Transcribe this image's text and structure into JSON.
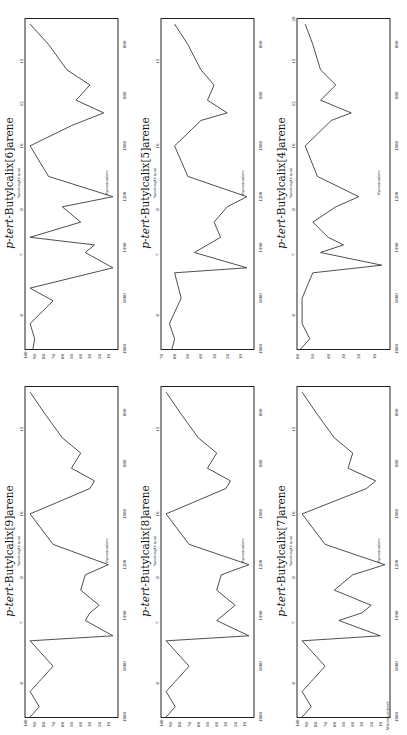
{
  "page": {
    "orientation": "rotated -90deg",
    "footer_text": "Wavenumbers"
  },
  "panels": [
    {
      "title_prefix": "p-tert-",
      "title_rest": "Butylcalix[6]arene",
      "wavelength_label": "Wavelength (um)",
      "wavenumber_label": "Wavenumbers",
      "y_ticks": [
        "100",
        "90",
        "80",
        "70",
        "60",
        "50",
        "40",
        "30",
        "20",
        "10"
      ],
      "x_ticks": [
        "1800",
        "1600",
        "1400",
        "1200",
        "1000",
        "800",
        "600"
      ],
      "w_ticks": [
        "6",
        "7",
        "8",
        "10",
        "12",
        "15"
      ]
    },
    {
      "title_prefix": "p-tert-",
      "title_rest": "Butylcalix[5]arene",
      "wavelength_label": "Wavelength (um)",
      "wavenumber_label": "Wavenumbers",
      "y_ticks": [
        "70",
        "60",
        "50",
        "40",
        "30",
        "20",
        "10"
      ],
      "x_ticks": [
        "1800",
        "1600",
        "1400",
        "1200",
        "1000",
        "800",
        "600"
      ],
      "w_ticks": [
        "6",
        "7",
        "8",
        "10",
        "15"
      ]
    },
    {
      "title_prefix": "p-tert-",
      "title_rest": "Butylcalix[4]arene",
      "wavelength_label": "Wavelength (um)",
      "wavenumber_label": "Wavenumbers",
      "y_ticks": [
        "60",
        "50",
        "40",
        "30",
        "20",
        "10"
      ],
      "x_ticks": [
        "1800",
        "1600",
        "1400",
        "1200",
        "1000",
        "800",
        "600"
      ],
      "w_ticks": [
        "6",
        "7",
        "8",
        "10",
        "12",
        "15",
        "20"
      ]
    },
    {
      "title_prefix": "p-tert-",
      "title_rest": "Butylcalix[9]arene",
      "wavelength_label": "Wavelength (um)",
      "wavenumber_label": "Wavenumbers",
      "y_ticks": [
        "100",
        "90",
        "80",
        "70",
        "60",
        "50",
        "40",
        "30",
        "20",
        "10"
      ],
      "x_ticks": [
        "1800",
        "1600",
        "1400",
        "1200",
        "1000",
        "800",
        "600"
      ],
      "w_ticks": [
        "6",
        "7",
        "8",
        "10",
        "15"
      ]
    },
    {
      "title_prefix": "p-tert-",
      "title_rest": "Butylcalix[8]arene",
      "wavelength_label": "Wavelength (um)",
      "wavenumber_label": "Wavenumbers",
      "y_ticks": [
        "100",
        "90",
        "80",
        "70",
        "60",
        "50",
        "40",
        "30",
        "20",
        "10"
      ],
      "x_ticks": [
        "1800",
        "1600",
        "1400",
        "1200",
        "1000",
        "800",
        "600"
      ],
      "w_ticks": [
        "6",
        "7",
        "8",
        "10",
        "15"
      ]
    },
    {
      "title_prefix": "p-tert-",
      "title_rest": "Butylcalix[7]arene",
      "wavelength_label": "Wavelength (um)",
      "wavenumber_label": "Wavenumbers",
      "y_ticks": [
        "100",
        "90",
        "80",
        "70",
        "60",
        "50",
        "40",
        "30",
        "20",
        "10"
      ],
      "x_ticks": [
        "1800",
        "1600",
        "1400",
        "1200",
        "1000",
        "800",
        "600"
      ],
      "w_ticks": [
        "6",
        "7",
        "8",
        "10",
        "15"
      ]
    }
  ],
  "chart_data": [
    {
      "type": "line",
      "title": "p-tert-Butylcalix[4]arene",
      "xlabel": "Wavenumbers",
      "ylabel": "%T",
      "xlim": [
        1800,
        500
      ],
      "ylim": [
        0,
        60
      ],
      "x": [
        1800,
        1760,
        1700,
        1600,
        1500,
        1470,
        1420,
        1390,
        1360,
        1300,
        1240,
        1200,
        1120,
        1000,
        900,
        870,
        820,
        760,
        700,
        600,
        520
      ],
      "y": [
        58,
        52,
        57,
        57,
        50,
        5,
        45,
        30,
        40,
        50,
        35,
        20,
        47,
        55,
        38,
        25,
        45,
        35,
        45,
        50,
        55
      ]
    },
    {
      "type": "line",
      "title": "p-tert-Butylcalix[5]arene",
      "xlabel": "Wavenumbers",
      "ylabel": "%T",
      "xlim": [
        1800,
        500
      ],
      "ylim": [
        0,
        70
      ],
      "x": [
        1800,
        1760,
        1700,
        1600,
        1500,
        1480,
        1420,
        1390,
        1360,
        1300,
        1240,
        1200,
        1120,
        1000,
        900,
        870,
        820,
        760,
        700,
        600,
        520
      ],
      "y": [
        62,
        60,
        64,
        55,
        60,
        5,
        45,
        35,
        25,
        30,
        20,
        5,
        50,
        60,
        40,
        20,
        35,
        30,
        40,
        50,
        60
      ]
    },
    {
      "type": "line",
      "title": "p-tert-Butylcalix[6]arene",
      "xlabel": "Wavenumbers",
      "ylabel": "%T",
      "xlim": [
        1800,
        500
      ],
      "ylim": [
        0,
        100
      ],
      "x": [
        1800,
        1760,
        1700,
        1610,
        1560,
        1480,
        1420,
        1390,
        1360,
        1300,
        1240,
        1200,
        1120,
        1000,
        920,
        870,
        820,
        760,
        700,
        600,
        520
      ],
      "y": [
        92,
        90,
        95,
        70,
        95,
        5,
        35,
        25,
        95,
        40,
        60,
        5,
        75,
        95,
        50,
        15,
        45,
        30,
        55,
        75,
        95
      ]
    },
    {
      "type": "line",
      "title": "p-tert-Butylcalix[7]arene",
      "xlabel": "Wavenumbers",
      "ylabel": "%T",
      "xlim": [
        1800,
        500
      ],
      "ylim": [
        0,
        100
      ],
      "x": [
        1800,
        1760,
        1700,
        1600,
        1500,
        1480,
        1420,
        1390,
        1360,
        1300,
        1240,
        1200,
        1120,
        1000,
        900,
        870,
        820,
        760,
        700,
        600,
        520
      ],
      "y": [
        95,
        85,
        95,
        70,
        95,
        10,
        55,
        30,
        20,
        60,
        40,
        5,
        70,
        95,
        25,
        15,
        45,
        40,
        60,
        80,
        95
      ]
    },
    {
      "type": "line",
      "title": "p-tert-Butylcalix[8]arene",
      "xlabel": "Wavenumbers",
      "ylabel": "%T",
      "xlim": [
        1800,
        500
      ],
      "ylim": [
        0,
        100
      ],
      "x": [
        1800,
        1760,
        1700,
        1600,
        1500,
        1480,
        1420,
        1390,
        1360,
        1300,
        1240,
        1200,
        1120,
        1000,
        900,
        870,
        820,
        760,
        700,
        600,
        520
      ],
      "y": [
        95,
        85,
        95,
        70,
        95,
        5,
        40,
        30,
        20,
        40,
        35,
        5,
        70,
        95,
        30,
        25,
        50,
        40,
        60,
        80,
        95
      ]
    },
    {
      "type": "line",
      "title": "p-tert-Butylcalix[9]arene",
      "xlabel": "Wavenumbers",
      "ylabel": "%T",
      "xlim": [
        1800,
        500
      ],
      "ylim": [
        0,
        100
      ],
      "x": [
        1800,
        1760,
        1700,
        1600,
        1500,
        1480,
        1420,
        1390,
        1360,
        1300,
        1240,
        1200,
        1120,
        1000,
        900,
        870,
        820,
        760,
        700,
        600,
        520
      ],
      "y": [
        95,
        85,
        95,
        70,
        95,
        5,
        35,
        30,
        20,
        40,
        35,
        10,
        70,
        95,
        30,
        25,
        50,
        40,
        60,
        80,
        95
      ]
    }
  ]
}
